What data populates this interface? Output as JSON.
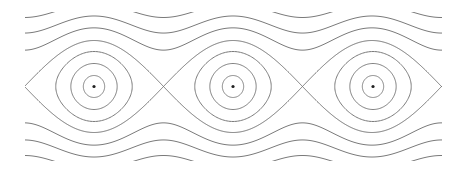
{
  "figure": {
    "description": "Phase portrait of the simple pendulum: level curves of H = p^2/2 - cos(theta)",
    "stroke_color": "#7a7a7a",
    "equilibrium_color": "#222222",
    "background": "#ffffff"
  },
  "plot": {
    "x_pixel_range": [
      25,
      442
    ],
    "y_pixel_range": [
      12,
      161
    ],
    "center_y": 86.5,
    "theta_range": [
      -3.14159,
      15.70796
    ],
    "theta_center_first": 0,
    "px_per_rad": 22.12,
    "px_per_p": 23
  },
  "levels": {
    "closed_orbits": [
      -0.886,
      -0.5,
      0.157
    ],
    "separatrix": 1.0,
    "open_orbits": [
      2.25,
      3.7,
      5.5
    ]
  },
  "equilibria": [
    {
      "x": 94,
      "y": 86.5,
      "type": "center"
    },
    {
      "x": 233,
      "y": 86.5,
      "type": "center"
    },
    {
      "x": 373,
      "y": 86.5,
      "type": "center"
    }
  ],
  "saddles": [
    {
      "x": 25,
      "y": 86.5
    },
    {
      "x": 163,
      "y": 86.5
    },
    {
      "x": 303,
      "y": 86.5
    },
    {
      "x": 442,
      "y": 86.5
    }
  ]
}
